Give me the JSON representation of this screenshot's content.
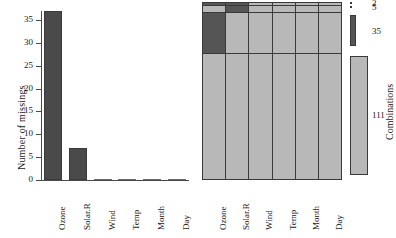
{
  "figure": {
    "width": 396,
    "height": 238,
    "background": "#ffffff",
    "colors": {
      "missing_dark": "#555555",
      "observed_light": "#b8b8b8",
      "bar_fill": "#4a4a4a",
      "axis": "#4a4a4a",
      "text": "#1a1a1a"
    }
  },
  "chart_data": [
    {
      "type": "bar",
      "panel": "left",
      "title": "",
      "xlabel": "",
      "ylabel": "Number of missings",
      "categories": [
        "Ozone",
        "Solar.R",
        "Wind",
        "Temp",
        "Month",
        "Day"
      ],
      "values": [
        37,
        7,
        0,
        0,
        0,
        0
      ],
      "ylim": [
        0,
        37
      ],
      "yticks": [
        0,
        5,
        10,
        15,
        20,
        25,
        30,
        35
      ],
      "ytick_labels": [
        "0",
        "5",
        "10",
        "15",
        "20",
        "25",
        "30",
        "35"
      ],
      "grid": false,
      "legend": "none",
      "bar_color": "#4a4a4a"
    },
    {
      "type": "heatmap",
      "panel": "right",
      "title": "",
      "xlabel": "",
      "ylabel": "Combinations",
      "columns": [
        "Ozone",
        "Solar.R",
        "Wind",
        "Temp",
        "Month",
        "Day"
      ],
      "row_counts": [
        2,
        5,
        35,
        111
      ],
      "row_count_labels": [
        "2",
        "5",
        "35",
        "111"
      ],
      "legend": "right",
      "cell_states": [
        [
          "missing",
          "missing",
          "observed",
          "observed",
          "observed",
          "observed"
        ],
        [
          "observed",
          "missing",
          "observed",
          "observed",
          "observed",
          "observed"
        ],
        [
          "missing",
          "observed",
          "observed",
          "observed",
          "observed",
          "observed"
        ],
        [
          "observed",
          "observed",
          "observed",
          "observed",
          "observed",
          "observed"
        ]
      ],
      "state_colors": {
        "missing": "#555555",
        "observed": "#b8b8b8"
      }
    }
  ]
}
